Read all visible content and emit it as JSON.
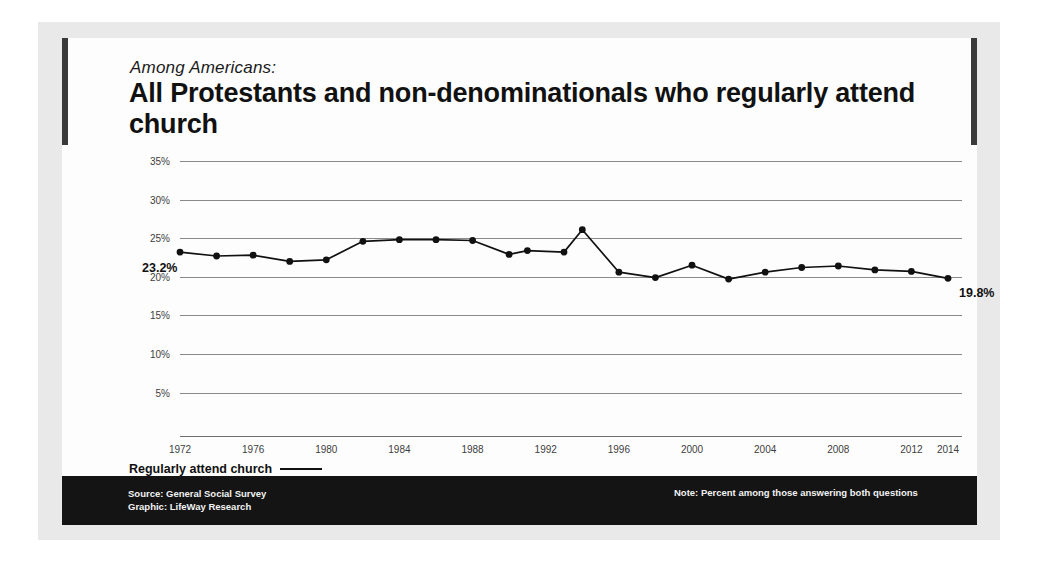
{
  "card": {
    "kicker": "Among Americans:",
    "headline": "All Protestants and non-denominationals who regularly attend church"
  },
  "legend": {
    "label": "Regularly attend church"
  },
  "footer": {
    "source": "Source: General Social Survey",
    "graphic": "Graphic: LifeWay Research",
    "note": "Note: Percent among those answering both questions"
  },
  "chart_data": {
    "type": "line",
    "title": "All Protestants and non-denominationals who regularly attend church",
    "subtitle": "Among Americans:",
    "xlabel": "",
    "ylabel": "",
    "ylim": [
      0,
      35
    ],
    "yticks": [
      "5%",
      "10%",
      "15%",
      "20%",
      "25%",
      "30%",
      "35%"
    ],
    "ytick_values": [
      5,
      10,
      15,
      20,
      25,
      30,
      35
    ],
    "xlim": [
      1972,
      2014
    ],
    "xticks": [
      "1972",
      "1976",
      "1980",
      "1984",
      "1988",
      "1992",
      "1996",
      "2000",
      "2004",
      "2008",
      "2012",
      "2014"
    ],
    "xtick_values": [
      1972,
      1976,
      1980,
      1984,
      1988,
      1992,
      1996,
      2000,
      2004,
      2008,
      2012,
      2014
    ],
    "grid": true,
    "legend_position": "bottom-left",
    "series": [
      {
        "name": "Regularly attend church",
        "x": [
          1972,
          1974,
          1976,
          1978,
          1980,
          1982,
          1984,
          1986,
          1988,
          1990,
          1991,
          1993,
          1994,
          1996,
          1998,
          2000,
          2002,
          2004,
          2006,
          2008,
          2010,
          2012,
          2014
        ],
        "values": [
          23.2,
          22.7,
          22.8,
          22.0,
          22.2,
          24.6,
          24.8,
          24.8,
          24.7,
          22.9,
          23.4,
          23.2,
          26.1,
          20.6,
          19.9,
          21.5,
          19.7,
          20.6,
          21.2,
          21.4,
          20.9,
          20.7,
          19.8
        ]
      }
    ],
    "annotations": [
      {
        "label": "23.2%",
        "x": 1972,
        "y": 23.2
      },
      {
        "label": "19.8%",
        "x": 2014,
        "y": 19.8
      }
    ]
  },
  "plot_geometry": {
    "left": 118,
    "right": 886,
    "y_top_value": 35,
    "y_top_px": 123,
    "px_per_percent": 7.72
  }
}
